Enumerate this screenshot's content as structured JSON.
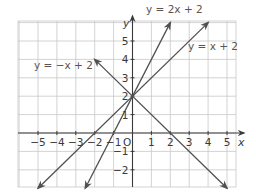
{
  "chart_data": {
    "type": "line",
    "title": "",
    "xlabel": "x",
    "ylabel": "y",
    "origin_label": "O",
    "xlim": [
      -6,
      5.5
    ],
    "ylim": [
      -3,
      6
    ],
    "grid": true,
    "x_ticks": [
      -5,
      -4,
      -3,
      -2,
      -1,
      1,
      2,
      3,
      4,
      5
    ],
    "y_ticks": [
      5,
      4,
      3,
      2,
      1,
      -1,
      -2
    ],
    "series": [
      {
        "name": "y = 2x + 2",
        "label": "y = 2x + 2",
        "slope": 2,
        "intercept": 2,
        "x_range": [
          -2.5,
          2
        ],
        "arrows": "both"
      },
      {
        "name": "y = x + 2",
        "label": "y = x + 2",
        "slope": 1,
        "intercept": 2,
        "x_range": [
          -5,
          4
        ],
        "arrows": "both"
      },
      {
        "name": "y = -x + 2",
        "label": "y = −x + 2",
        "slope": -1,
        "intercept": 2,
        "x_range": [
          -2,
          5
        ],
        "arrows": "both"
      }
    ],
    "annotations": [
      {
        "text": "y = 2x + 2",
        "x": 1.2,
        "y": 6.6
      },
      {
        "text": "y = x + 2",
        "x": 3.3,
        "y": 4.8
      },
      {
        "text": "y = −x + 2",
        "x": -5.1,
        "y": 3.8
      }
    ],
    "colors": {
      "line": "#505050",
      "grid": "#c8c8c8",
      "axis": "#3a3a3a",
      "text": "#3a3a3a"
    }
  },
  "labels": {
    "x_axis": "x",
    "y_axis": "y",
    "origin": "O",
    "eq_2x": "y = 2x + 2",
    "eq_x": "y = x + 2",
    "eq_negx": "y = −x + 2"
  }
}
